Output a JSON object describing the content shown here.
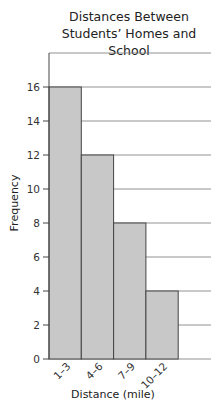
{
  "chart_data": {
    "type": "bar",
    "subtype": "histogram",
    "title_lines": [
      "Distances Between",
      "Students’ Homes and School"
    ],
    "xlabel": "Distance (mile)",
    "ylabel": "Frequency",
    "categories": [
      "1–3",
      "4–6",
      "7–9",
      "10–12"
    ],
    "values": [
      16,
      12,
      8,
      4
    ],
    "ylim": [
      0,
      18
    ],
    "yticks": [
      0,
      2,
      4,
      6,
      8,
      10,
      12,
      14,
      16
    ],
    "grid": true,
    "legend": null,
    "bar_color": "#c8c8c8",
    "bar_edge_color": "#444444"
  }
}
